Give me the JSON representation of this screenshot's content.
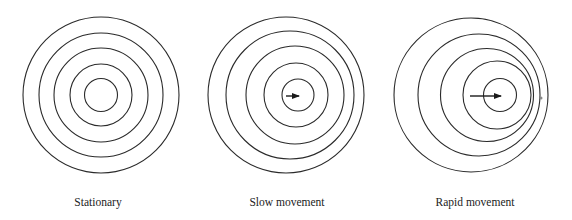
{
  "figure": {
    "stroke_color": "#2a2a2a",
    "background": "#ffffff",
    "panels": [
      {
        "id": "stationary",
        "label": "Stationary",
        "label_x": 98,
        "circles": [
          {
            "cx": 101,
            "cy": 95,
            "r": 78
          },
          {
            "cx": 101,
            "cy": 95,
            "r": 62
          },
          {
            "cx": 101,
            "cy": 95,
            "r": 47
          },
          {
            "cx": 101,
            "cy": 95,
            "r": 31
          },
          {
            "cx": 101,
            "cy": 95,
            "r": 16.5
          }
        ],
        "arrow": null
      },
      {
        "id": "slow-movement",
        "label": "Slow movement",
        "label_x": 287,
        "circles": [
          {
            "cx": 286,
            "cy": 95,
            "r": 78
          },
          {
            "cx": 290,
            "cy": 95,
            "r": 64
          },
          {
            "cx": 295,
            "cy": 95,
            "r": 49
          },
          {
            "cx": 296,
            "cy": 95,
            "r": 32
          },
          {
            "cx": 298,
            "cy": 95,
            "r": 16
          }
        ],
        "arrow": {
          "x1": 286,
          "y1": 96,
          "x2": 299,
          "y2": 96
        }
      },
      {
        "id": "rapid-movement",
        "label": "Rapid movement",
        "label_x": 475,
        "circles": [
          {
            "cx": 471,
            "cy": 95,
            "r": 77
          },
          {
            "cx": 479,
            "cy": 95,
            "r": 61
          },
          {
            "cx": 487,
            "cy": 95,
            "r": 46.5
          },
          {
            "cx": 497,
            "cy": 95,
            "r": 34
          },
          {
            "cx": 500,
            "cy": 95,
            "r": 16.5
          }
        ],
        "arrow": {
          "x1": 470,
          "y1": 96,
          "x2": 501,
          "y2": 96
        },
        "speck": {
          "cx": 541,
          "cy": 98,
          "r": 1.5
        }
      }
    ]
  }
}
